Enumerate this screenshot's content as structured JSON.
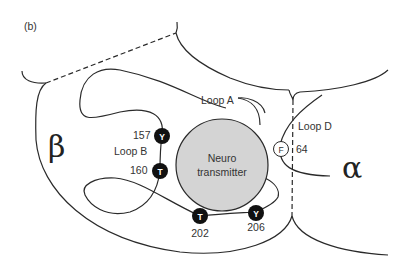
{
  "panel_label": "(b)",
  "subunits": {
    "beta": {
      "symbol": "β"
    },
    "alpha": {
      "symbol": "α"
    }
  },
  "ligand": {
    "label_line1": "Neuro",
    "label_line2": "transmitter",
    "fill_color": "#d4d4d4"
  },
  "loops": [
    {
      "name": "Loop A"
    },
    {
      "name": "Loop B"
    },
    {
      "name": "Loop D"
    }
  ],
  "residues": [
    {
      "letter": "Y",
      "number": "157",
      "style": "filled"
    },
    {
      "letter": "T",
      "number": "160",
      "style": "filled"
    },
    {
      "letter": "T",
      "number": "202",
      "style": "filled"
    },
    {
      "letter": "Y",
      "number": "206",
      "style": "filled"
    },
    {
      "letter": "F",
      "number": "64",
      "style": "open"
    }
  ],
  "colors": {
    "line": "#2a2a2a",
    "residue_fill": "#111111",
    "background": "#ffffff"
  }
}
